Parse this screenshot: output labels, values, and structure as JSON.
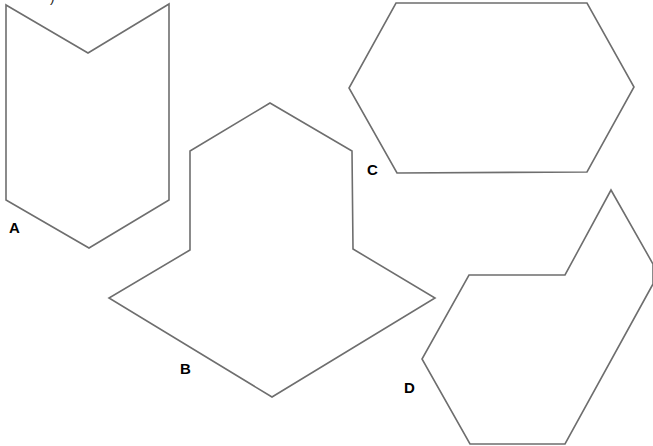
{
  "figure": {
    "background": "#ffffff",
    "line_color": "#6e6e6e",
    "label_color": "#000000",
    "cut_off_text_top": ")"
  },
  "shapes": [
    {
      "label": "A",
      "kind": "chevron-hexagon (arrow/notched pentagon-hexagon)",
      "points": "6,5 88,53 169,4 169,200 89,248 6,200",
      "label_pos": {
        "x": 9,
        "y": 220
      }
    },
    {
      "label": "B",
      "kind": "octagon (house-on-rhombus)",
      "points": "270,103 352,151 353,249 435,298 272,397 109,298 190,250 190,151",
      "label_pos": {
        "x": 180,
        "y": 361
      }
    },
    {
      "label": "C",
      "kind": "elongated hexagon",
      "points": "396,3 587,3 634,87 587,172 397,173 349,88",
      "label_pos": {
        "x": 367,
        "y": 162
      }
    },
    {
      "label": "D",
      "kind": "irregular heptagon",
      "points": "469,275 565,275 611,190 653,264 653,284 565,444 470,444 422,359",
      "label_pos": {
        "x": 404,
        "y": 380
      }
    }
  ]
}
